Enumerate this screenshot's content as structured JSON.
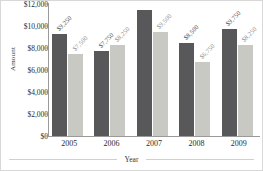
{
  "chart_data": {
    "type": "bar",
    "title": "",
    "xlabel": "Year",
    "ylabel": "Amount",
    "categories": [
      "2005",
      "2006",
      "2007",
      "2008",
      "2009"
    ],
    "series": [
      {
        "name": "Series 1",
        "color": "#58585a",
        "values": [
          9250,
          7750,
          11500,
          8500,
          9750
        ],
        "labels": [
          "$9,250",
          "$7,750",
          "",
          "$8,500",
          "$9,750"
        ]
      },
      {
        "name": "Series 2",
        "color": "#c9c9c4",
        "values": [
          7500,
          8250,
          9500,
          6750,
          8250
        ],
        "labels": [
          "$7,500",
          "$8,250",
          "$9,500",
          "$6,750",
          "$8,250"
        ]
      }
    ],
    "ylim": [
      0,
      12000
    ],
    "ytick_values": [
      0,
      2000,
      4000,
      6000,
      8000,
      10000,
      12000
    ],
    "ytick_labels": [
      "$0",
      "$2,000",
      "$4,000",
      "$6,000",
      "$8,000",
      "$10,000",
      "$12,000"
    ],
    "grid": false,
    "legend": "none"
  }
}
